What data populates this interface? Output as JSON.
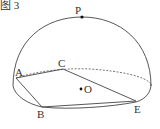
{
  "figure": {
    "caption": "图 3",
    "points": {
      "P": "P",
      "A": "A",
      "B": "B",
      "C": "C",
      "E": "E",
      "O": "O"
    },
    "stroke_color": "#444444"
  }
}
